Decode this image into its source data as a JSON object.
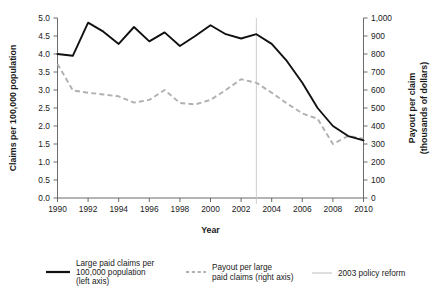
{
  "chart_data": {
    "type": "line",
    "title": "",
    "xlabel": "Year",
    "ylabel": "Claims per 100,000 population",
    "y2label": "Payout per claim (thousands of dollars)",
    "x": [
      1990,
      1991,
      1992,
      1993,
      1994,
      1995,
      1996,
      1997,
      1998,
      1999,
      2000,
      2001,
      2002,
      2003,
      2004,
      2005,
      2006,
      2007,
      2008,
      2009,
      2010
    ],
    "xlim": [
      1990,
      2010
    ],
    "xticks": [
      1990,
      1992,
      1994,
      1996,
      1998,
      2000,
      2002,
      2004,
      2006,
      2008,
      2010
    ],
    "xtick_labels": [
      "1990",
      "1992",
      "1994",
      "1996",
      "1998",
      "2000",
      "2002",
      "2004",
      "2006",
      "2008",
      "2010"
    ],
    "ylim": [
      0.0,
      5.0
    ],
    "yticks": [
      0.0,
      0.5,
      1.0,
      1.5,
      2.0,
      2.5,
      3.0,
      3.5,
      4.0,
      4.5,
      5.0
    ],
    "ytick_labels": [
      "0.0",
      "0.5",
      "1.0",
      "1.5",
      "2.0",
      "2.5",
      "3.0",
      "3.5",
      "4.0",
      "4.5",
      "5.0"
    ],
    "y2lim": [
      0,
      1000
    ],
    "y2ticks": [
      0,
      100,
      200,
      300,
      400,
      500,
      600,
      700,
      800,
      900,
      1000
    ],
    "y2tick_labels": [
      "0",
      "100",
      "200",
      "300",
      "400",
      "500",
      "600",
      "700",
      "800",
      "900",
      "1,000"
    ],
    "grid": false,
    "legend_position": "below",
    "series": [
      {
        "name": "Large paid claims per 100,000 population (left axis)",
        "axis": "left",
        "style": "solid",
        "color": "#111111",
        "values": [
          4.0,
          3.95,
          4.87,
          4.62,
          4.28,
          4.75,
          4.35,
          4.6,
          4.22,
          4.5,
          4.8,
          4.55,
          4.43,
          4.55,
          4.28,
          3.8,
          3.2,
          2.5,
          2.0,
          1.72,
          1.6
        ]
      },
      {
        "name": "Payout per large paid claims (right axis)",
        "axis": "right",
        "style": "dashed",
        "color": "#b0b0b0",
        "values": [
          745,
          598,
          585,
          575,
          565,
          530,
          545,
          600,
          528,
          520,
          545,
          600,
          660,
          640,
          585,
          525,
          470,
          440,
          300,
          345,
          330
        ]
      }
    ],
    "annotations": [
      {
        "name": "2003 policy reform",
        "type": "vertical-line",
        "x": 2003,
        "color": "#c9c9c9"
      }
    ],
    "legend": [
      {
        "label_line1": "Large paid claims per",
        "label_line2": "100,000 population",
        "label_line3": "(left axis)",
        "style": "solid"
      },
      {
        "label_line1": "Payout per large",
        "label_line2": "paid claims (right axis)",
        "label_line3": "",
        "style": "dashed"
      },
      {
        "label_line1": "2003 policy reform",
        "label_line2": "",
        "label_line3": "",
        "style": "marker"
      }
    ]
  }
}
